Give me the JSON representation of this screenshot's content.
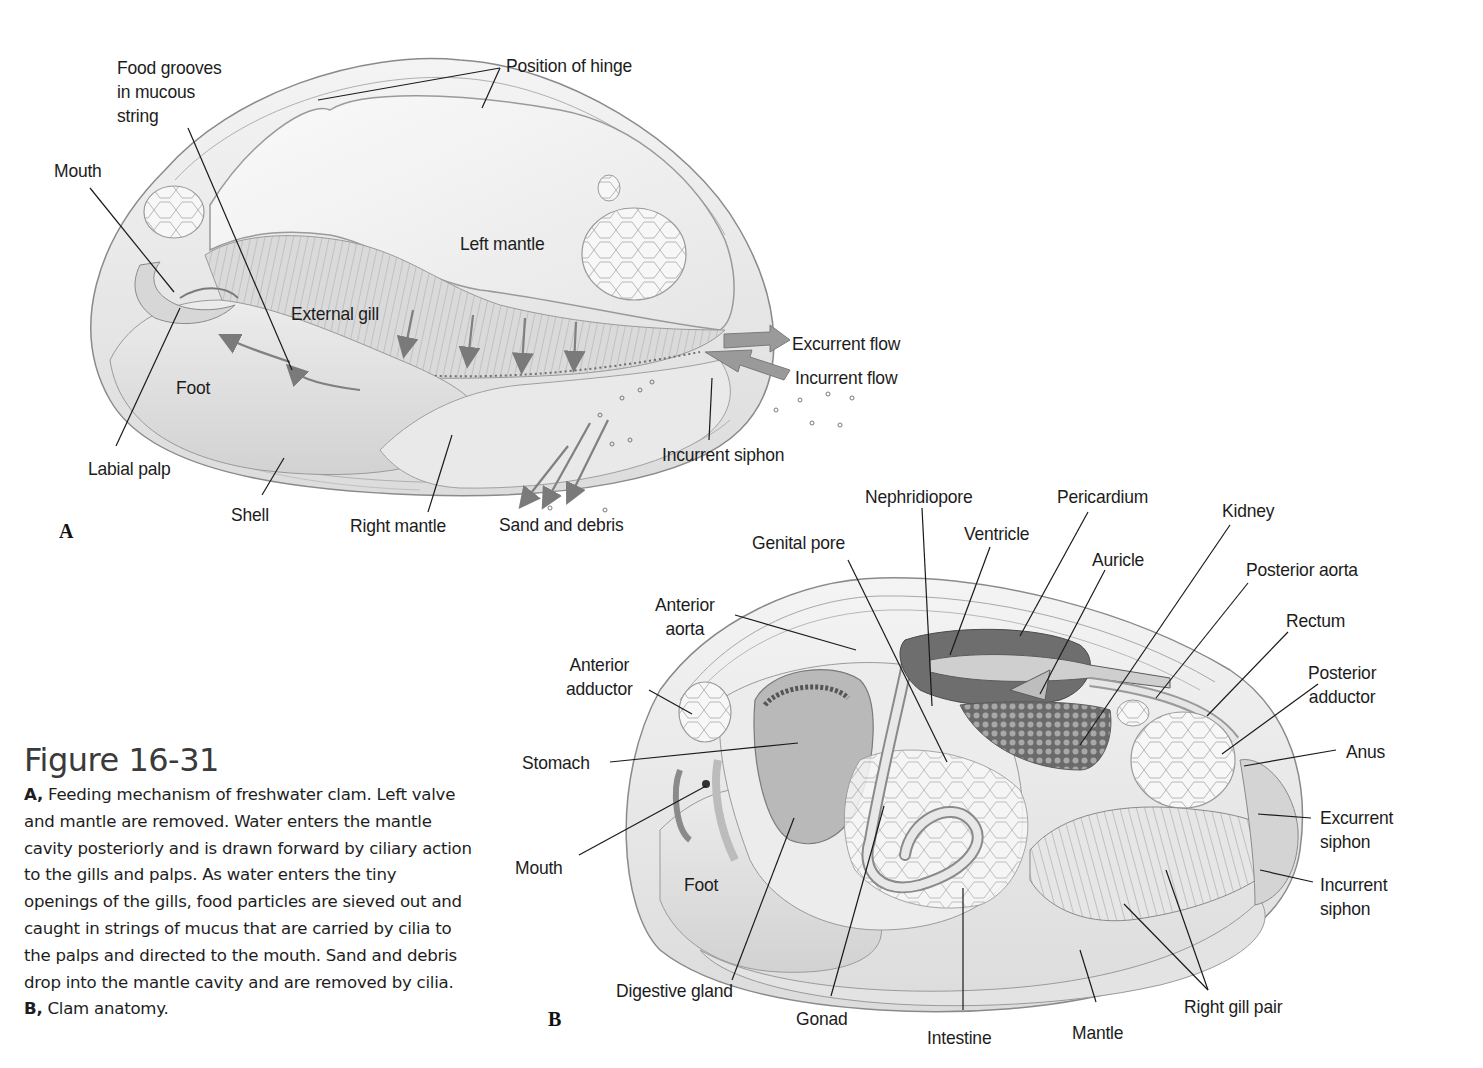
{
  "figure": {
    "title": "Figure 16-31",
    "caption": {
      "a_marker": "A,",
      "a_text": " Feeding mechanism of freshwater clam. Left valve and mantle are removed. Water enters the mantle cavity posteriorly and is drawn forward by ciliary action to the gills and palps. As water enters the tiny openings of the gills, food particles are sieved out and caught in strings of mucus that are carried by cilia to the palps and directed to the mouth. Sand and debris drop into the mantle cavity and are removed by cilia. ",
      "b_marker": "B,",
      "b_text": " Clam anatomy."
    }
  },
  "panel_a": {
    "letter": "A",
    "labels": {
      "food_grooves": "Food grooves\nin mucous\nstring",
      "position_of_hinge": "Position of hinge",
      "mouth": "Mouth",
      "left_mantle": "Left mantle",
      "external_gill": "External gill",
      "foot": "Foot",
      "labial_palp": "Labial palp",
      "shell": "Shell",
      "right_mantle": "Right mantle",
      "sand_and_debris": "Sand and debris",
      "incurrent_siphon": "Incurrent siphon",
      "excurrent_flow": "Excurrent flow",
      "incurrent_flow": "Incurrent flow"
    }
  },
  "panel_b": {
    "letter": "B",
    "labels": {
      "nephridiopore": "Nephridiopore",
      "pericardium": "Pericardium",
      "kidney": "Kidney",
      "genital_pore": "Genital pore",
      "ventricle": "Ventricle",
      "auricle": "Auricle",
      "posterior_aorta": "Posterior aorta",
      "anterior_aorta": "Anterior\naorta",
      "rectum": "Rectum",
      "anterior_adductor": "Anterior\nadductor",
      "posterior_adductor": "Posterior\nadductor",
      "stomach": "Stomach",
      "anus": "Anus",
      "excurrent_siphon": "Excurrent\nsiphon",
      "mouth": "Mouth",
      "foot": "Foot",
      "incurrent_siphon": "Incurrent\nsiphon",
      "digestive_gland": "Digestive gland",
      "gonad": "Gonad",
      "intestine": "Intestine",
      "mantle": "Mantle",
      "right_gill_pair": "Right gill pair"
    }
  },
  "colors": {
    "line": "#1a1a1a",
    "shell_outline": "#8a8a8a",
    "flow_arrow": "#8c8c8c",
    "tissue_light": "#efefef",
    "tissue_mid": "#d6d6d6",
    "tissue_dark": "#8f8f8f"
  }
}
